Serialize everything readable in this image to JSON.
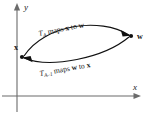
{
  "figure": {
    "axes": {
      "x_label": "x",
      "y_label": "y",
      "origin": [
        17,
        96
      ]
    },
    "nodes": [
      {
        "id": "x",
        "label": "x",
        "position": [
          22,
          57
        ]
      },
      {
        "id": "w",
        "label": "w",
        "position": [
          131,
          36
        ]
      }
    ],
    "edges": [
      {
        "id": "forward",
        "from": "x",
        "to": "w",
        "direction": "right",
        "label_parts": {
          "operator": "T",
          "subscript": "A",
          "text": " maps ",
          "source": "x",
          "connector": " to ",
          "target": "w"
        },
        "label_full": "T_A maps x to w"
      },
      {
        "id": "inverse",
        "from": "w",
        "to": "x",
        "direction": "left",
        "label_parts": {
          "operator": "T",
          "subscript": "A–1",
          "text": " maps ",
          "source": "w",
          "connector": " to ",
          "target": "x"
        },
        "label_full": "T_{A-1} maps w to x"
      }
    ],
    "colors": {
      "axis": "#6b6b6b",
      "curve": "#111111",
      "text": "#1a1a1a",
      "background": "#ffffff"
    }
  }
}
